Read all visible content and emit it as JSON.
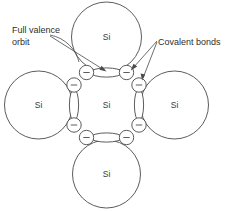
{
  "figure": {
    "background_color": "#ffffff",
    "line_color": "#4a4a4a",
    "text_color": "#2e2e2e",
    "width": 228,
    "height": 211
  },
  "annotations": {
    "full_valence_orbit": {
      "line1": "Full valence",
      "line2": "orbit"
    },
    "covalent_bonds": {
      "line1": "Covalent bonds"
    }
  },
  "atoms": {
    "center": {
      "label": "Si"
    },
    "top": {
      "label": "Si"
    },
    "left": {
      "label": "Si"
    },
    "right": {
      "label": "Si"
    },
    "bottom": {
      "label": "Si"
    }
  },
  "electrons": {
    "charge_symbol": "−",
    "count": 8
  }
}
